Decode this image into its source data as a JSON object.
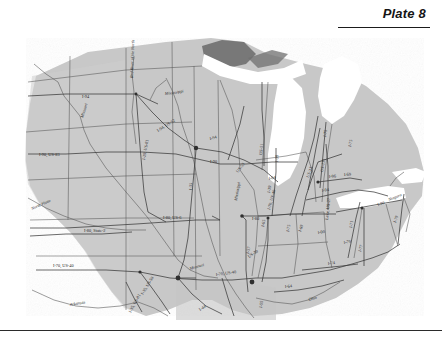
{
  "header": {
    "plate_label": "Plate 8",
    "rule": "horizontal-rule"
  },
  "footer": {
    "rule": "horizontal-rule"
  },
  "map": {
    "title": "Plate 8",
    "description": "Grayscale scanned map of the United States Midwest and Great Lakes region showing state outlines, interstate highway corridors and major rivers",
    "land_color": "#c8c8c8",
    "water_color": "#ffffff",
    "lake_superior_shade": "#6f6f6f",
    "border_color": "#4a4a4a",
    "road_color": "#3a3a3a",
    "labels": [
      {
        "id": "l01",
        "text": "Red River of the North",
        "kind": "river",
        "x": 127,
        "y": 58,
        "rotate": -88
      },
      {
        "id": "l02",
        "text": "Missouri",
        "kind": "river",
        "x": 77,
        "y": 98,
        "rotate": -72
      },
      {
        "id": "l03",
        "text": "Mississippi",
        "kind": "river",
        "x": 159,
        "y": 75,
        "rotate": -8
      },
      {
        "id": "l04",
        "text": "North Platte",
        "kind": "river",
        "x": 26,
        "y": 190,
        "rotate": -24
      },
      {
        "id": "l05",
        "text": "Arkansas",
        "kind": "river",
        "x": 64,
        "y": 286,
        "rotate": -10
      },
      {
        "id": "l06",
        "text": "Missouri",
        "kind": "river",
        "x": 184,
        "y": 250,
        "rotate": -16
      },
      {
        "id": "l07",
        "text": "Ohio",
        "kind": "river",
        "x": 303,
        "y": 281,
        "rotate": -17
      },
      {
        "id": "l08",
        "text": "Niagara",
        "kind": "river",
        "x": 383,
        "y": 181,
        "rotate": -22
      },
      {
        "id": "l09",
        "text": "I-94",
        "kind": "highway",
        "x": 76,
        "y": 78,
        "rotate": 0
      },
      {
        "id": "l10",
        "text": "I-90, US-83",
        "kind": "highway",
        "x": 33,
        "y": 136,
        "rotate": 0
      },
      {
        "id": "l11",
        "text": "I-94, US-52",
        "kind": "highway",
        "x": 152,
        "y": 112,
        "rotate": -32
      },
      {
        "id": "l12",
        "text": "I-29, US-81",
        "kind": "highway",
        "x": 139,
        "y": 140,
        "rotate": -80
      },
      {
        "id": "l13",
        "text": "I-35",
        "kind": "highway",
        "x": 186,
        "y": 170,
        "rotate": -88
      },
      {
        "id": "l14",
        "text": "I-80, US-6",
        "kind": "highway",
        "x": 157,
        "y": 199,
        "rotate": 0
      },
      {
        "id": "l15",
        "text": "I-80, State-2",
        "kind": "highway",
        "x": 78,
        "y": 212,
        "rotate": 0
      },
      {
        "id": "l16",
        "text": "I-70, US-40",
        "kind": "highway",
        "x": 47,
        "y": 247,
        "rotate": 0
      },
      {
        "id": "l17",
        "text": "I-35, US-50",
        "kind": "highway",
        "x": 137,
        "y": 275,
        "rotate": -58
      },
      {
        "id": "l18",
        "text": "I-35, US-81",
        "kind": "highway",
        "x": 125,
        "y": 293,
        "rotate": -62
      },
      {
        "id": "l19",
        "text": "I-44",
        "kind": "highway",
        "x": 194,
        "y": 291,
        "rotate": -32
      },
      {
        "id": "l20",
        "text": "I-70, US-40",
        "kind": "highway",
        "x": 210,
        "y": 256,
        "rotate": -8
      },
      {
        "id": "l21",
        "text": "I-55",
        "kind": "highway",
        "x": 256,
        "y": 288,
        "rotate": -82
      },
      {
        "id": "l22",
        "text": "I-94",
        "kind": "highway",
        "x": 204,
        "y": 120,
        "rotate": -14
      },
      {
        "id": "l23",
        "text": "I-90",
        "kind": "highway",
        "x": 204,
        "y": 143,
        "rotate": 0
      },
      {
        "id": "l24",
        "text": "US-53",
        "kind": "highway",
        "x": 232,
        "y": 153,
        "rotate": -52
      },
      {
        "id": "l25",
        "text": "US-51",
        "kind": "highway",
        "x": 256,
        "y": 135,
        "rotate": -84
      },
      {
        "id": "l26",
        "text": "I-39",
        "kind": "highway",
        "x": 272,
        "y": 142,
        "rotate": -86
      },
      {
        "id": "l27",
        "text": "I-94",
        "kind": "highway",
        "x": 263,
        "y": 160,
        "rotate": -12
      },
      {
        "id": "l28",
        "text": "I-39",
        "kind": "highway",
        "x": 264,
        "y": 173,
        "rotate": -80
      },
      {
        "id": "l29",
        "text": "Mississippi",
        "kind": "river",
        "x": 231,
        "y": 181,
        "rotate": -80
      },
      {
        "id": "l30",
        "text": "I-80",
        "kind": "highway",
        "x": 246,
        "y": 200,
        "rotate": 0
      },
      {
        "id": "l31",
        "text": "I-65",
        "kind": "highway",
        "x": 258,
        "y": 207,
        "rotate": -78
      },
      {
        "id": "l32",
        "text": "I-70, US-40",
        "kind": "highway",
        "x": 264,
        "y": 190,
        "rotate": -74
      },
      {
        "id": "l33",
        "text": "I-57",
        "kind": "highway",
        "x": 243,
        "y": 234,
        "rotate": -78
      },
      {
        "id": "l34",
        "text": "US-30",
        "kind": "highway",
        "x": 243,
        "y": 238,
        "rotate": -34
      },
      {
        "id": "l35",
        "text": "I-69",
        "kind": "highway",
        "x": 295,
        "y": 212,
        "rotate": -72
      },
      {
        "id": "l36",
        "text": "I-75",
        "kind": "highway",
        "x": 283,
        "y": 212,
        "rotate": -78
      },
      {
        "id": "l37",
        "text": "Lake, US-27",
        "kind": "highway",
        "x": 322,
        "y": 200,
        "rotate": -84
      },
      {
        "id": "l38",
        "text": "US-23",
        "kind": "highway",
        "x": 303,
        "y": 158,
        "rotate": -72
      },
      {
        "id": "l39",
        "text": "US-131",
        "kind": "highway",
        "x": 317,
        "y": 152,
        "rotate": -80
      },
      {
        "id": "l40",
        "text": "I-96",
        "kind": "highway",
        "x": 323,
        "y": 158,
        "rotate": -6
      },
      {
        "id": "l41",
        "text": "I-69",
        "kind": "highway",
        "x": 338,
        "y": 156,
        "rotate": -4
      },
      {
        "id": "l42",
        "text": "I-94",
        "kind": "highway",
        "x": 316,
        "y": 172,
        "rotate": -8
      },
      {
        "id": "l43",
        "text": "I-75",
        "kind": "highway",
        "x": 320,
        "y": 117,
        "rotate": -82
      },
      {
        "id": "l44",
        "text": "I-75",
        "kind": "highway",
        "x": 345,
        "y": 127,
        "rotate": -78
      },
      {
        "id": "l45",
        "text": "I-71",
        "kind": "highway",
        "x": 346,
        "y": 208,
        "rotate": -80
      },
      {
        "id": "l46",
        "text": "I-70",
        "kind": "highway",
        "x": 338,
        "y": 224,
        "rotate": -12
      },
      {
        "id": "l47",
        "text": "I-77",
        "kind": "highway",
        "x": 355,
        "y": 232,
        "rotate": -76
      },
      {
        "id": "l48",
        "text": "I-79",
        "kind": "highway",
        "x": 390,
        "y": 203,
        "rotate": -72
      },
      {
        "id": "l49",
        "text": "I-74",
        "kind": "highway",
        "x": 322,
        "y": 245,
        "rotate": -8
      },
      {
        "id": "l50",
        "text": "I-64",
        "kind": "highway",
        "x": 279,
        "y": 268,
        "rotate": -6
      },
      {
        "id": "l51",
        "text": "I-90",
        "kind": "highway",
        "x": 312,
        "y": 214,
        "rotate": -10
      },
      {
        "id": "l52",
        "text": "I-80",
        "kind": "highway",
        "x": 372,
        "y": 186,
        "rotate": -18
      }
    ]
  }
}
